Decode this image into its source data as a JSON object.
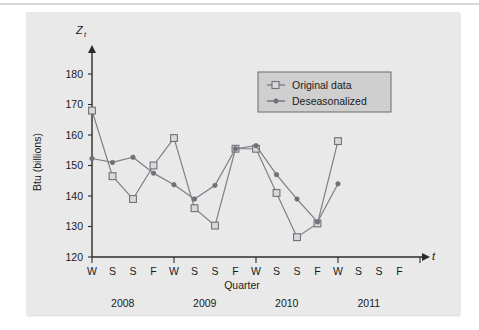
{
  "figure": {
    "background_color": "#e9e9e9",
    "axis_color": "#2b2b2b",
    "series_color": "#7c7f86",
    "y_axis_variable": "Z",
    "y_axis_subscript": "t",
    "x_axis_variable": "t",
    "y_axis_title": "Btu (billions)",
    "x_axis_title": "Quarter"
  },
  "legend": {
    "position": "upper-right",
    "background_color": "#cfcfcf",
    "entries": [
      {
        "label": "Original data",
        "marker": "square"
      },
      {
        "label": "Deseasonalized",
        "marker": "dot"
      }
    ]
  },
  "chart_data": {
    "type": "line",
    "title": "",
    "xlabel": "Quarter",
    "ylabel": "Btu (billions)",
    "ylim": [
      120,
      185
    ],
    "yticks": [
      120,
      130,
      140,
      150,
      160,
      170,
      180
    ],
    "grid": false,
    "x": [
      "W",
      "S",
      "S",
      "F",
      "W",
      "S",
      "S",
      "F",
      "W",
      "S",
      "S",
      "F",
      "W",
      "S",
      "S",
      "F"
    ],
    "x_group_labels": [
      "2008",
      "2009",
      "2010",
      "2011"
    ],
    "x_group_span": 4,
    "series": [
      {
        "name": "Original data",
        "marker": "square",
        "values": [
          168.0,
          146.5,
          139.0,
          150.0,
          159.0,
          136.0,
          130.3,
          155.5,
          155.5,
          141.0,
          126.5,
          131.0,
          158.0,
          137.5,
          128.0,
          141.8
        ]
      },
      {
        "name": "Deseasonalized",
        "marker": "dot",
        "values": [
          152.3,
          151.0,
          152.7,
          147.5,
          143.7,
          139.0,
          143.5,
          155.5,
          156.5,
          147.0,
          139.0,
          131.5,
          144.0,
          141.5,
          141.3,
          141.5
        ]
      }
    ],
    "n_plotted_points": 13,
    "note": "Series are plotted for the first 13 time points (2008 W through 2011 W); the remaining x-axis tick labels (2011 S, S, F) have no data."
  }
}
